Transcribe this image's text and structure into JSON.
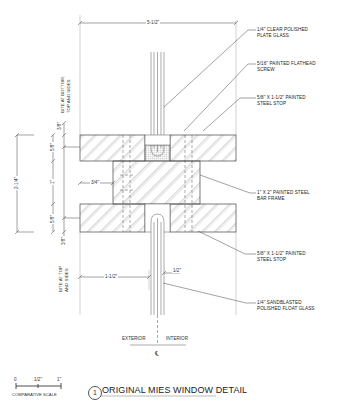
{
  "drawing": {
    "title_number": "1",
    "title": "ORIGINAL MIES WINDOW DETAIL",
    "dimensions": {
      "overall_width": "5-1/2\"",
      "overall_height": "2-1/4\"",
      "top_bite": "3/8\"",
      "top_stop": "5/8\"",
      "bar_height": "1\"",
      "bottom_stop": "5/8\"",
      "bottom_bite": "3/8\"",
      "bar_offset": "3/4\"",
      "lower_offset": "1-1/2\"",
      "glass_thickness": "1/2\""
    },
    "side_notes": {
      "top": [
        "BITE AT BOTTOM,",
        "TOP AND SIDES"
      ],
      "bottom": [
        "BITE AT TOP",
        "AND SIDES"
      ]
    },
    "callouts": [
      {
        "lines": [
          "1/4\" CLEAR POLISHED",
          "PLATE GLASS"
        ]
      },
      {
        "lines": [
          "5/16\" PAINTED FLATHEAD",
          "SCREW"
        ]
      },
      {
        "lines": [
          "5/8\" x 1-1/2\" PAINTED",
          "STEEL STOP"
        ]
      },
      {
        "lines": [
          "1\" x 2\" PAINTED STEEL",
          "BAR FRAME"
        ]
      },
      {
        "lines": [
          "5/8\" x 1-1/2\" PAINTED",
          "STEEL STOP"
        ]
      },
      {
        "lines": [
          "1/4\" SANDBLASTED",
          "POLISHED FLOAT GLASS"
        ]
      }
    ],
    "orientation": {
      "exterior": "EXTERIOR",
      "interior": "INTERIOR",
      "centerline": "℄"
    },
    "scale": {
      "ticks": [
        "0",
        "1/2\"",
        "1\""
      ],
      "label": "COMPARATIVE SCALE"
    }
  }
}
